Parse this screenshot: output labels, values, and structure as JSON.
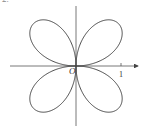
{
  "diagram": {
    "type": "polar-curve",
    "origin_label": "O",
    "x_tick_label": "1",
    "top_text": "2.",
    "colors": {
      "curve": "#444444",
      "axis": "#555555",
      "background": "#ffffff"
    }
  }
}
